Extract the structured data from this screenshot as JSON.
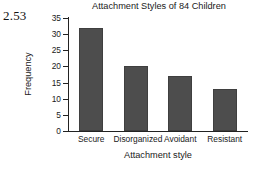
{
  "exercise_number": "2.53",
  "chart_data": {
    "type": "bar",
    "title": "Attachment Styles of 84 Children",
    "xlabel": "Attachment style",
    "ylabel": "Frequency",
    "categories": [
      "Secure",
      "Disorganized",
      "Avoidant",
      "Resistant"
    ],
    "values": [
      32,
      20,
      17,
      13
    ],
    "ylim": [
      0,
      35
    ],
    "yticks": [
      0,
      5,
      10,
      15,
      20,
      25,
      30,
      35
    ],
    "ytick_labels": [
      "0",
      "5",
      "10",
      "15",
      "20",
      "25",
      "30",
      "35"
    ],
    "grid": false,
    "legend": "none",
    "bar_color": "#4d4d4d",
    "axis_color": "#222222",
    "background": "#ffffff"
  }
}
